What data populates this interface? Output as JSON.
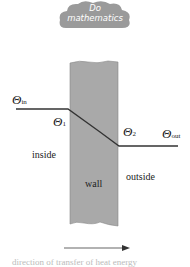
{
  "badge": {
    "line1": "Do",
    "line2": "mathematics"
  },
  "diagram": {
    "theta_symbol": "Θ",
    "theta_in_sub": "in",
    "theta_1_sub": "1",
    "theta_2_sub": "2",
    "theta_out_sub": "out",
    "inside_label": "inside",
    "wall_label": "wall",
    "outside_label": "outside",
    "caption": "direction of transfer of heat energy"
  },
  "colors": {
    "wall": "#a9a9a9",
    "cloud": "#9a9a9a",
    "line": "#333333"
  }
}
